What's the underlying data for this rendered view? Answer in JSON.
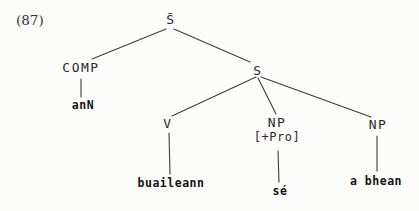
{
  "figure": {
    "number": "(87)"
  },
  "tree": {
    "nodes": {
      "s_bar": {
        "label": "S̄"
      },
      "comp": {
        "label": "COMP"
      },
      "s": {
        "label": "S"
      },
      "ann": {
        "label": "anN"
      },
      "v": {
        "label": "V"
      },
      "np_pro": {
        "label": "NP",
        "feature": "[+Pro]"
      },
      "np_obj": {
        "label": "NP"
      },
      "buaileann": {
        "label": "buaileann"
      },
      "se": {
        "label": "sé"
      },
      "a_bhean": {
        "label": "a bhean"
      }
    },
    "edges": [
      {
        "from": "s_bar",
        "to": "comp"
      },
      {
        "from": "s_bar",
        "to": "s"
      },
      {
        "from": "comp",
        "to": "ann"
      },
      {
        "from": "s",
        "to": "v"
      },
      {
        "from": "s",
        "to": "np_pro"
      },
      {
        "from": "s",
        "to": "np_obj"
      },
      {
        "from": "v",
        "to": "buaileann"
      },
      {
        "from": "np_pro",
        "to": "se"
      },
      {
        "from": "np_obj",
        "to": "a_bhean"
      }
    ]
  },
  "colors": {
    "ink": "#2b2b2b",
    "paper": "#fcfcfa",
    "line": "#3d3d3d"
  }
}
